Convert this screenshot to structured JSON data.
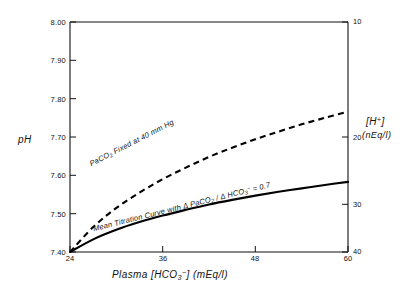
{
  "chart_data": {
    "type": "line",
    "title": "",
    "xlabel": "Plasma [HCO3-] (mEq/l)",
    "ylabel": "pH",
    "y2label": "[H+] (nEq/l)",
    "xlim": [
      24,
      60
    ],
    "ylim": [
      7.4,
      8.0
    ],
    "y2lim": [
      40,
      10
    ],
    "grid": false,
    "legend": "inline-annotations",
    "xticks": [
      24,
      36,
      48,
      60
    ],
    "xtick_labels": [
      "24",
      "36",
      "48",
      "60"
    ],
    "yticks": [
      7.4,
      7.5,
      7.6,
      7.7,
      7.8,
      7.9,
      8.0
    ],
    "ytick_labels": [
      "7.40",
      "7.50",
      "7.60",
      "7.70",
      "7.80",
      "7.90",
      "8.00"
    ],
    "y2ticks": [
      10,
      20,
      30,
      40
    ],
    "y2tick_labels": [
      "10",
      "20",
      "30",
      "40"
    ],
    "series": [
      {
        "name": "PaCO2 Fixed at 40 mm Hg",
        "style": "dashed",
        "x": [
          24,
          27,
          30,
          33,
          36,
          39,
          42,
          45,
          48,
          51,
          54,
          57,
          60
        ],
        "values": [
          7.4,
          7.465,
          7.515,
          7.555,
          7.59,
          7.62,
          7.648,
          7.672,
          7.694,
          7.714,
          7.733,
          7.75,
          7.766
        ]
      },
      {
        "name": "Mean Titration Curve with Δ PaCO2 / Δ HCO3- = 0.7",
        "style": "solid",
        "x": [
          24,
          27,
          30,
          33,
          36,
          39,
          42,
          45,
          48,
          51,
          54,
          57,
          60
        ],
        "values": [
          7.4,
          7.433,
          7.458,
          7.478,
          7.495,
          7.51,
          7.524,
          7.536,
          7.547,
          7.557,
          7.566,
          7.575,
          7.583
        ]
      }
    ]
  },
  "axes": {
    "left_title": "pH",
    "right_title_line1": "[H⁺]",
    "right_title_line2": "(nEq/l)",
    "bottom_title_prefix": "Plasma ",
    "bottom_title_bracket_open": "[",
    "bottom_title_species": "HCO",
    "bottom_title_species_sub": "3",
    "bottom_title_species_sup": "−",
    "bottom_title_bracket_close": "]",
    "bottom_title_units": " (mEq/l)"
  },
  "annotations": {
    "upper_curve": {
      "text_prefix": "PaCO",
      "text_sub": "2",
      "text_rest": " Fixed at 40 mm Hg"
    },
    "lower_curve": {
      "text_prefix": "Mean Titration Curve with Δ PaCO",
      "text_sub1": "2",
      "text_mid": " / Δ HCO",
      "text_sub2": "3",
      "text_sup2": "−",
      "text_rest": " = 0.7"
    }
  },
  "colors": {
    "axis": "#111111",
    "curve": "#000000",
    "background": "#ffffff"
  }
}
